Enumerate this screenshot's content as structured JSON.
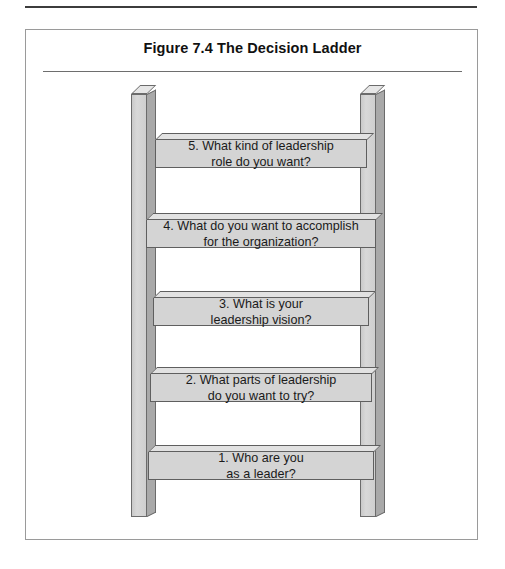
{
  "figure": {
    "title": "Figure 7.4  The Decision Ladder",
    "colors": {
      "rung_face": "#d4d4d4",
      "rung_top": "#e2e2e2",
      "rail_face": "#d2d2d2",
      "rail_side": "#a9a9a9",
      "outline": "#5f5f5f",
      "box_border": "#9a9a9a",
      "rule": "#3c3c3c",
      "text": "#1a1a1a"
    }
  },
  "ladder": {
    "rungs": [
      {
        "number": "5",
        "label": "5. What kind of leadership\nrole do you want?",
        "left": 129,
        "top": 103,
        "width": 212,
        "height": 35
      },
      {
        "number": "4",
        "label": "4. What do you want to accomplish\nfor the organization?",
        "left": 120,
        "top": 183,
        "width": 230,
        "height": 35
      },
      {
        "number": "3",
        "label": "3. What is your\nleadership vision?",
        "left": 127,
        "top": 261,
        "width": 216,
        "height": 35
      },
      {
        "number": "2",
        "label": "2. What parts of leadership\ndo you want to try?",
        "left": 124,
        "top": 337,
        "width": 222,
        "height": 35
      },
      {
        "number": "1",
        "label": "1. Who are you\nas a leader?",
        "left": 122,
        "top": 415,
        "width": 226,
        "height": 35
      }
    ]
  }
}
